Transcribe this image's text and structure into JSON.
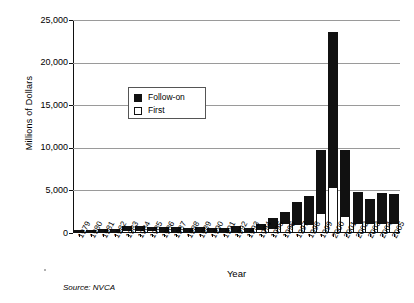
{
  "chart_data": {
    "type": "bar",
    "title": "",
    "xlabel": "Year",
    "ylabel": "Millions of Dollars",
    "ylim": [
      0,
      25000
    ],
    "yticks": [
      0,
      5000,
      10000,
      15000,
      20000,
      25000
    ],
    "ytick_labels": [
      "0",
      "5,000",
      "10,000",
      "15,000",
      "20,000",
      "25,000"
    ],
    "grid": true,
    "stacked": true,
    "legend_position": "upper-left-inside",
    "legend": [
      "Follow-on",
      "First"
    ],
    "categories": [
      "1979",
      "1980",
      "1981",
      "1982",
      "1983",
      "1984",
      "1985",
      "1986",
      "1987",
      "1988",
      "1989",
      "1990",
      "1991",
      "1992",
      "1993",
      "1994",
      "1995",
      "1996",
      "1997",
      "1998",
      "1999",
      "2000",
      "2001",
      "2002",
      "2003",
      "2004",
      "2005"
    ],
    "series": [
      {
        "name": "First",
        "color": "#ffffff",
        "values": [
          120,
          140,
          190,
          260,
          380,
          380,
          300,
          290,
          280,
          270,
          280,
          250,
          250,
          280,
          230,
          420,
          560,
          1150,
          1100,
          1100,
          2300,
          5400,
          2000,
          1150,
          1150,
          1200,
          1150
        ]
      },
      {
        "name": "Follow-on",
        "color": "#111111",
        "values": [
          130,
          140,
          200,
          250,
          470,
          470,
          400,
          400,
          370,
          360,
          370,
          350,
          360,
          540,
          380,
          680,
          1240,
          1350,
          2500,
          3200,
          7400,
          18200,
          7750,
          3650,
          2850,
          3550,
          3400
        ]
      }
    ],
    "totals": [
      250,
      280,
      390,
      510,
      850,
      850,
      700,
      690,
      650,
      630,
      650,
      600,
      610,
      820,
      610,
      1100,
      1800,
      2500,
      3600,
      4300,
      9700,
      23600,
      9750,
      4800,
      4000,
      4750,
      4550
    ],
    "source_note": "Source: NVCA"
  }
}
